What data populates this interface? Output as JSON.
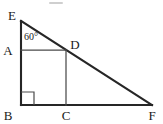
{
  "figure": {
    "background_color": "#ffffff",
    "stroke_color": "#262626",
    "inner_stroke_color": "#4a4a4a",
    "label_color": "#1a1a1a",
    "vertices": {
      "E": {
        "label": "E",
        "x": 21,
        "y": 21
      },
      "A": {
        "label": "A",
        "x": 21,
        "y": 50
      },
      "B": {
        "label": "B",
        "x": 21,
        "y": 105
      },
      "C": {
        "label": "C",
        "x": 66,
        "y": 105
      },
      "D": {
        "label": "D",
        "x": 66,
        "y": 50
      },
      "F": {
        "label": "F",
        "x": 152,
        "y": 105
      }
    },
    "angles": [
      {
        "name": "angle-at-E",
        "value": "60°",
        "at": "E",
        "x": 24,
        "y": 39
      }
    ],
    "right_angles": [
      {
        "name": "right-angle-at-B",
        "at": "B",
        "size": 13
      }
    ],
    "segments": [
      {
        "name": "segment-EB",
        "from": "E",
        "to": "B",
        "kind": "main"
      },
      {
        "name": "segment-BF",
        "from": "B",
        "to": "F",
        "kind": "main"
      },
      {
        "name": "segment-EF",
        "from": "E",
        "to": "F",
        "kind": "main"
      },
      {
        "name": "segment-AD",
        "from": "A",
        "to": "D",
        "kind": "inner"
      },
      {
        "name": "segment-DC",
        "from": "D",
        "to": "C",
        "kind": "inner"
      }
    ],
    "label_positions": {
      "E": {
        "x": 12,
        "y": 20
      },
      "A": {
        "x": 7,
        "y": 55
      },
      "B": {
        "x": 7,
        "y": 120
      },
      "C": {
        "x": 61,
        "y": 120
      },
      "D": {
        "x": 70,
        "y": 49
      },
      "F": {
        "x": 147,
        "y": 120
      }
    }
  }
}
